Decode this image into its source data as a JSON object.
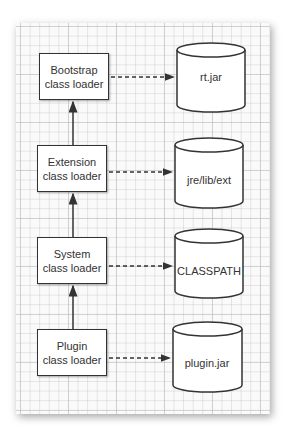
{
  "diagram": {
    "loaders": [
      {
        "id": "bootstrap",
        "line1": "Bootstrap",
        "line2": "class loader",
        "top": 53
      },
      {
        "id": "extension",
        "line1": "Extension",
        "line2": "class loader",
        "top": 145
      },
      {
        "id": "system",
        "line1": "System",
        "line2": "class loader",
        "top": 237
      },
      {
        "id": "plugin",
        "line1": "Plugin",
        "line2": "class loader",
        "top": 329
      }
    ],
    "sources": [
      {
        "id": "rt-jar",
        "label": "rt.jar"
      },
      {
        "id": "jre-lib-ext",
        "label": "jre/lib/ext"
      },
      {
        "id": "classpath",
        "label": "CLASSPATH"
      },
      {
        "id": "plugin-jar",
        "label": "plugin.jar"
      }
    ],
    "colors": {
      "stroke": "#333333",
      "fill": "#ffffff",
      "grid": "#c8c8c8",
      "panel": "#fafafa"
    }
  }
}
